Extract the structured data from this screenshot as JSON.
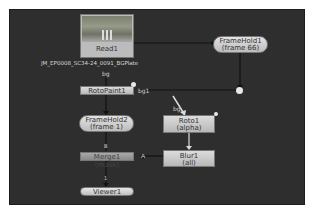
{
  "canvas": {
    "background": "#2e2e2e"
  },
  "nodes": {
    "read1": {
      "name": "Read1",
      "file": "JM_EP0008_SC34-24_0091_BGPlate"
    },
    "framehold1": {
      "name": "FrameHold1",
      "param": "(frame 66)"
    },
    "rotopaint1": {
      "name": "RotoPaint1"
    },
    "framehold2": {
      "name": "FrameHold2",
      "param": "(frame 1)"
    },
    "roto1": {
      "name": "Roto1",
      "param": "(alpha)"
    },
    "merge1": {
      "name": "Merge1 (mask)"
    },
    "blur1": {
      "name": "Blur1",
      "param": "(all)"
    },
    "viewer1": {
      "name": "Viewer1"
    }
  },
  "pipe_labels": {
    "read_to_rotopaint": "bg",
    "rotopaint_bg1": "bg1",
    "roto_input": "bg",
    "merge_b": "B",
    "merge_a": "A",
    "viewer_input": "1"
  }
}
